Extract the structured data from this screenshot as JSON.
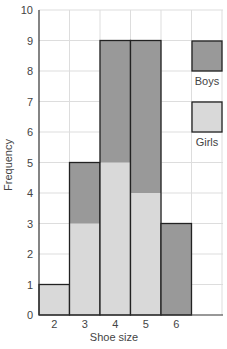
{
  "chart_data": {
    "type": "bar",
    "stacked": true,
    "title": "",
    "xlabel": "Shoe size",
    "ylabel": "Frequency",
    "categories": [
      "2",
      "3",
      "4",
      "5",
      "6"
    ],
    "series": [
      {
        "name": "Girls",
        "values": [
          1,
          3,
          5,
          4,
          0
        ],
        "color": "#d9d9d9"
      },
      {
        "name": "Boys",
        "values": [
          0,
          2,
          4,
          5,
          3
        ],
        "color": "#999999"
      }
    ],
    "totals": [
      1,
      5,
      9,
      9,
      3
    ],
    "ylim": [
      0,
      10
    ],
    "yticks": [
      0,
      1,
      2,
      3,
      4,
      5,
      6,
      7,
      8,
      9,
      10
    ],
    "grid": true,
    "legend": {
      "position": "right",
      "entries": [
        "Boys",
        "Girls"
      ]
    }
  },
  "labels": {
    "xlabel": "Shoe size",
    "ylabel": "Frequency",
    "legend_boys": "Boys",
    "legend_girls": "Girls"
  }
}
